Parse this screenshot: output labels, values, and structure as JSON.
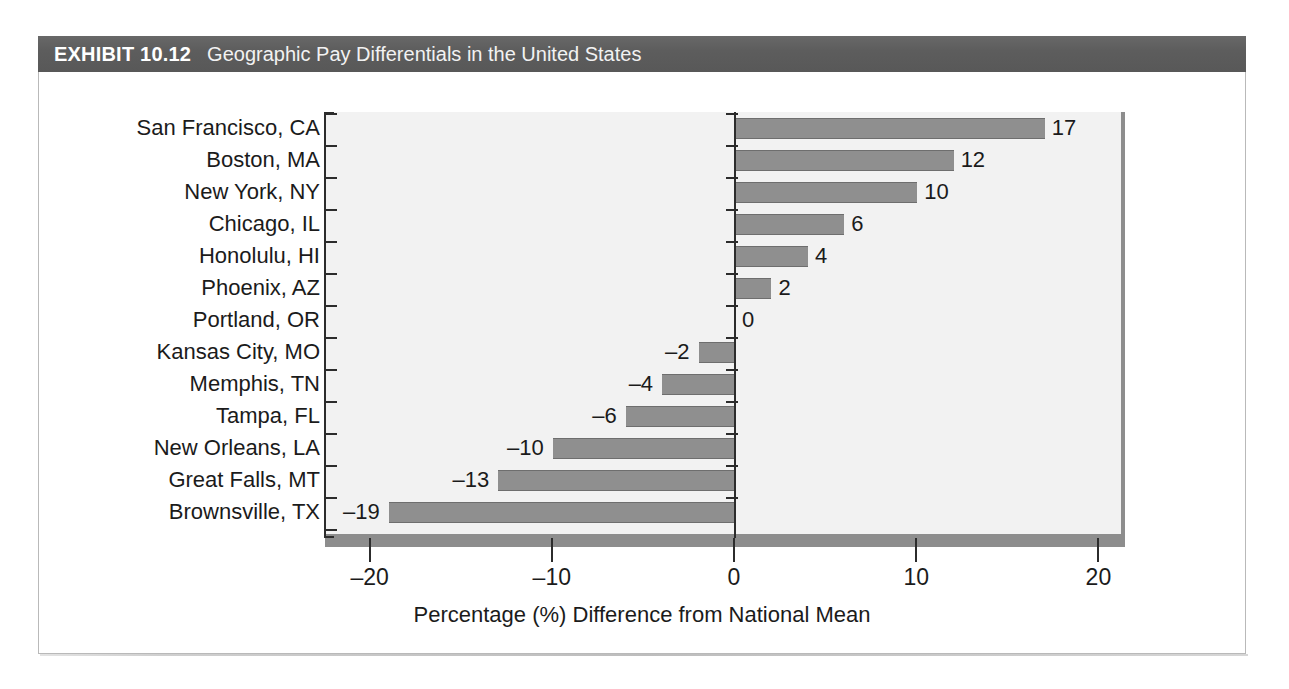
{
  "exhibit": {
    "number": "EXHIBIT 10.12",
    "title": "Geographic Pay Differentials in the United States"
  },
  "colors": {
    "header_band": "#5e5e5e",
    "plot_background": "#f2f2f2",
    "bar_fill": "#8f8f8f",
    "bar_edge": "#6e6e6e",
    "axis": "#2c2c2c",
    "panel_shadow": "#8d8d8d",
    "frame_border": "#b9b9b9",
    "text": "#1b1b1b",
    "header_text": "#ffffff"
  },
  "chart_data": {
    "type": "bar",
    "orientation": "horizontal",
    "title": "Geographic Pay Differentials in the United States",
    "xlabel": "Percentage (%) Difference from National Mean",
    "ylabel": "",
    "xlim": [
      -22.8,
      21.2
    ],
    "xticks": [
      -20,
      -10,
      0,
      10,
      20
    ],
    "xtick_labels": [
      "–20",
      "–10",
      "0",
      "10",
      "20"
    ],
    "grid": false,
    "legend": null,
    "categories": [
      "San Francisco, CA",
      "Boston, MA",
      "New York, NY",
      "Chicago, IL",
      "Honolulu, HI",
      "Phoenix, AZ",
      "Portland, OR",
      "Kansas City, MO",
      "Memphis, TN",
      "Tampa, FL",
      "New Orleans, LA",
      "Great Falls, MT",
      "Brownsville, TX"
    ],
    "values": [
      17,
      12,
      10,
      6,
      4,
      2,
      0,
      -2,
      -4,
      -6,
      -10,
      -13,
      -19
    ],
    "value_labels": [
      "17",
      "12",
      "10",
      "6",
      "4",
      "2",
      "0",
      "–2",
      "–4",
      "–6",
      "–10",
      "–13",
      "–19"
    ]
  }
}
